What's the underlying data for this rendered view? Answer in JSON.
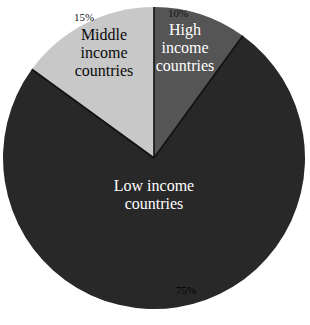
{
  "chart_data": {
    "type": "pie",
    "title": "",
    "subtitle": "",
    "xlabel": "",
    "ylabel": "",
    "legend_position": "none",
    "grid": false,
    "units": "percent",
    "labels_inside": true,
    "start_angle_deg": 0,
    "direction": "clockwise",
    "categories": [
      "High income countries",
      "Low income countries",
      "Middle income countries"
    ],
    "values": [
      10,
      75,
      15
    ],
    "slices": [
      {
        "name": "high-income",
        "label": "High\nincome\ncountries",
        "label_flat": "High income countries",
        "percent_label": "10%",
        "value": 10,
        "color": "#555555",
        "label_color": "#ffffff",
        "percent_color": "#141414",
        "start_angle_deg": 0,
        "end_angle_deg": 36
      },
      {
        "name": "low-income",
        "label": "Low income\ncountries",
        "label_flat": "Low income countries",
        "percent_label": "75%",
        "value": 75,
        "color": "#282828",
        "label_color": "#ffffff",
        "percent_color": "#000000",
        "start_angle_deg": 36,
        "end_angle_deg": 306
      },
      {
        "name": "middle-income",
        "label": "Middle\nincome\ncountries",
        "label_flat": "Middle income countries",
        "percent_label": "15%",
        "value": 15,
        "color": "#c8c8c8",
        "label_color": "#0a0a0a",
        "percent_color": "#141414",
        "start_angle_deg": 306,
        "end_angle_deg": 360
      }
    ],
    "geometry": {
      "center_x": 154,
      "center_y": 158,
      "radius": 151,
      "background": "#ffffff",
      "divider_color": "#111111"
    }
  }
}
